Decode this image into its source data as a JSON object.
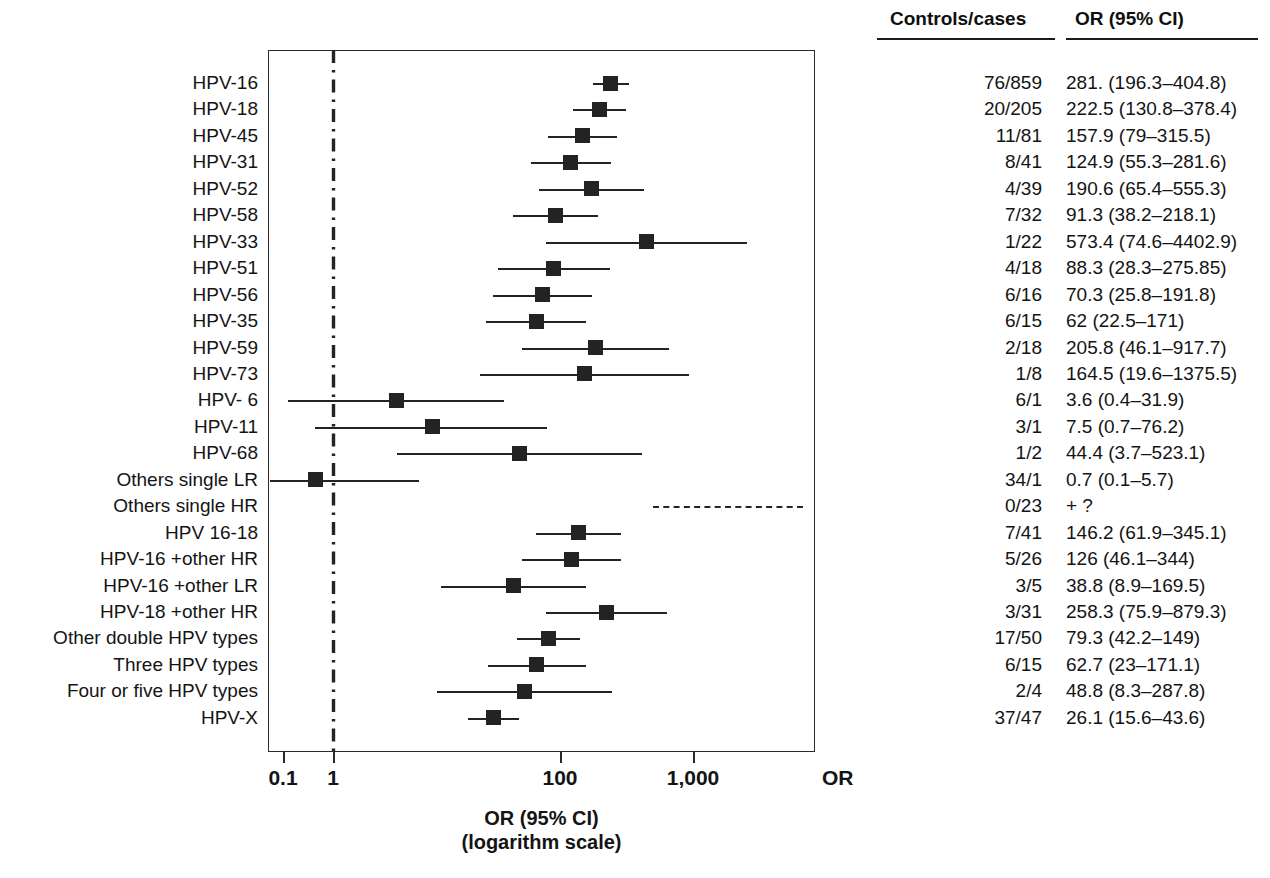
{
  "figure": {
    "axis_title_line1": "OR (95% CI)",
    "axis_title_line2": "(logarithm scale)",
    "axis_or_mark": "OR",
    "controls_header": "Controls/cases",
    "or_header": "OR (95% CI)"
  },
  "chart_data": {
    "type": "scatter",
    "subtype": "forest-plot",
    "title": "",
    "xlabel": "OR (95% CI) (logarithm scale)",
    "ylabel": "",
    "xscale": "log",
    "xlim": [
      0.1,
      3000
    ],
    "xticks": [
      0.1,
      1,
      100,
      1000
    ],
    "xticklabels": [
      "0.1",
      "1",
      "100",
      "1,000"
    ],
    "grid": false,
    "reference_line": 1,
    "legend": "none",
    "columns": [
      "Controls/cases",
      "OR (95% CI)"
    ],
    "rows": [
      {
        "label": "HPV-16",
        "controls_cases": "76/859",
        "or_text": "281. (196.3–404.8)",
        "or": 281.0,
        "lo": 196.3,
        "hi": 404.8
      },
      {
        "label": "HPV-18",
        "controls_cases": "20/205",
        "or_text": "222.5 (130.8–378.4)",
        "or": 222.5,
        "lo": 130.8,
        "hi": 378.4
      },
      {
        "label": "HPV-45",
        "controls_cases": "11/81",
        "or_text": "157.9 (79–315.5)",
        "or": 157.9,
        "lo": 79.0,
        "hi": 315.5
      },
      {
        "label": "HPV-31",
        "controls_cases": "8/41",
        "or_text": "124.9 (55.3–281.6)",
        "or": 124.9,
        "lo": 55.3,
        "hi": 281.6
      },
      {
        "label": "HPV-52",
        "controls_cases": "4/39",
        "or_text": "190.6 (65.4–555.3)",
        "or": 190.6,
        "lo": 65.4,
        "hi": 555.3
      },
      {
        "label": "HPV-58",
        "controls_cases": "7/32",
        "or_text": "91.3 (38.2–218.1)",
        "or": 91.3,
        "lo": 38.2,
        "hi": 218.1
      },
      {
        "label": "HPV-33",
        "controls_cases": "1/22",
        "or_text": "573.4 (74.6–4402.9)",
        "or": 573.4,
        "lo": 74.6,
        "hi": 4402.9
      },
      {
        "label": "HPV-51",
        "controls_cases": "4/18",
        "or_text": "88.3 (28.3–275.85)",
        "or": 88.3,
        "lo": 28.3,
        "hi": 275.85
      },
      {
        "label": "HPV-56",
        "controls_cases": "6/16",
        "or_text": "70.3 (25.8–191.8)",
        "or": 70.3,
        "lo": 25.8,
        "hi": 191.8
      },
      {
        "label": "HPV-35",
        "controls_cases": "6/15",
        "or_text": "62 (22.5–171)",
        "or": 62.0,
        "lo": 22.5,
        "hi": 171.0
      },
      {
        "label": "HPV-59",
        "controls_cases": "2/18",
        "or_text": "205.8 (46.1–917.7)",
        "or": 205.8,
        "lo": 46.1,
        "hi": 917.7
      },
      {
        "label": "HPV-73",
        "controls_cases": "1/8",
        "or_text": "164.5 (19.6–1375.5)",
        "or": 164.5,
        "lo": 19.6,
        "hi": 1375.5
      },
      {
        "label": "HPV- 6",
        "controls_cases": "6/1",
        "or_text": "3.6 (0.4–31.9)",
        "or": 3.6,
        "lo": 0.4,
        "hi": 31.9
      },
      {
        "label": "HPV-11",
        "controls_cases": "3/1",
        "or_text": "7.5 (0.7–76.2)",
        "or": 7.5,
        "lo": 0.7,
        "hi": 76.2
      },
      {
        "label": "HPV-68",
        "controls_cases": "1/2",
        "or_text": "44.4 (3.7–523.1)",
        "or": 44.4,
        "lo": 3.7,
        "hi": 523.1
      },
      {
        "label": "Others single LR",
        "controls_cases": "34/1",
        "or_text": "0.7 (0.1–5.7)",
        "or": 0.7,
        "lo": 0.1,
        "hi": 5.7
      },
      {
        "label": "Others single HR",
        "controls_cases": "0/23",
        "or_text": "+ ?",
        "or": null,
        "lo": null,
        "hi": null,
        "undefined_estimate": true
      },
      {
        "label": "HPV 16-18",
        "controls_cases": "7/41",
        "or_text": "146.2 (61.9–345.1)",
        "or": 146.2,
        "lo": 61.9,
        "hi": 345.1
      },
      {
        "label": "HPV-16 +other HR",
        "controls_cases": "5/26",
        "or_text": "126 (46.1–344)",
        "or": 126.0,
        "lo": 46.1,
        "hi": 344.0
      },
      {
        "label": "HPV-16 +other LR",
        "controls_cases": "3/5",
        "or_text": "38.8 (8.9–169.5)",
        "or": 38.8,
        "lo": 8.9,
        "hi": 169.5
      },
      {
        "label": "HPV-18 +other HR",
        "controls_cases": "3/31",
        "or_text": "258.3 (75.9–879.3)",
        "or": 258.3,
        "lo": 75.9,
        "hi": 879.3
      },
      {
        "label": "Other double HPV types",
        "controls_cases": "17/50",
        "or_text": "79.3 (42.2–149)",
        "or": 79.3,
        "lo": 42.2,
        "hi": 149.0
      },
      {
        "label": "Three HPV types",
        "controls_cases": "6/15",
        "or_text": "62.7 (23–171.1)",
        "or": 62.7,
        "lo": 23.0,
        "hi": 171.1
      },
      {
        "label": "Four or five HPV types",
        "controls_cases": "2/4",
        "or_text": "48.8 (8.3–287.8)",
        "or": 48.8,
        "lo": 8.3,
        "hi": 287.8
      },
      {
        "label": "HPV-X",
        "controls_cases": "37/47",
        "or_text": "26.1 (15.6–43.6)",
        "or": 26.1,
        "lo": 15.6,
        "hi": 43.6
      }
    ]
  },
  "colors": {
    "ink": "#232323",
    "frame": "#2a2a2a",
    "background": "#ffffff"
  }
}
